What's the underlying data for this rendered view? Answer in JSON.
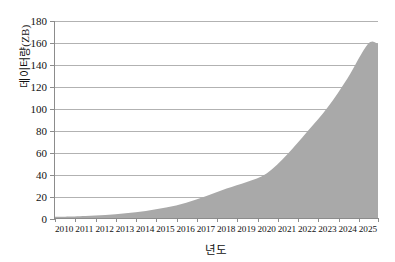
{
  "chart_data": {
    "type": "area",
    "title": "",
    "xlabel": "년도",
    "ylabel": "데이터량(ZB)",
    "categories": [
      "2010",
      "2011",
      "2012",
      "2013",
      "2014",
      "2015",
      "2016",
      "2017",
      "2018",
      "2019",
      "2020",
      "2021",
      "2022",
      "2023",
      "2024",
      "2025"
    ],
    "values": [
      1.2,
      1.8,
      2.8,
      4.4,
      6.5,
      9.5,
      14,
      20,
      27,
      33,
      41,
      58,
      79,
      101,
      128,
      159
    ],
    "series": [
      {
        "name": "데이터량(ZB)",
        "values": [
          1.2,
          1.8,
          2.8,
          4.4,
          6.5,
          9.5,
          14,
          20,
          27,
          33,
          41,
          58,
          79,
          101,
          128,
          159
        ]
      }
    ],
    "ylim": [
      0,
      180
    ],
    "yticks": [
      0,
      20,
      40,
      60,
      80,
      100,
      120,
      140,
      160,
      180
    ],
    "ytick_labels": [
      "0",
      "20",
      "40",
      "60",
      "80",
      "100",
      "120",
      "140",
      "160",
      "180"
    ],
    "grid": true,
    "grid_axis": "y",
    "legend": false,
    "legend_position": "none",
    "colors": {
      "area_fill": "#a9a9a9",
      "gridline": "#b2b2b2",
      "axis": "#8c8c8c",
      "text": "#111111",
      "background": "#ffffff"
    }
  }
}
